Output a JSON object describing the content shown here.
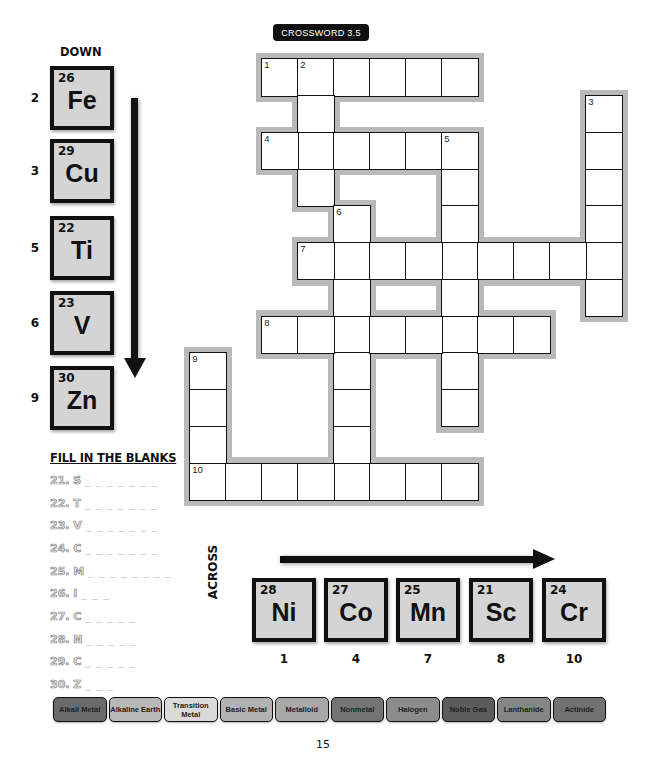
{
  "title": "CROSSWORD 3.5",
  "down": {
    "heading": "DOWN",
    "clues": [
      {
        "number": "2",
        "atomic_number": "26",
        "symbol": "Fe"
      },
      {
        "number": "3",
        "atomic_number": "29",
        "symbol": "Cu"
      },
      {
        "number": "5",
        "atomic_number": "22",
        "symbol": "Ti"
      },
      {
        "number": "6",
        "atomic_number": "23",
        "symbol": "V"
      },
      {
        "number": "9",
        "atomic_number": "30",
        "symbol": "Zn"
      }
    ]
  },
  "across": {
    "heading": "ACROSS",
    "clues": [
      {
        "number": "1",
        "atomic_number": "28",
        "symbol": "Ni"
      },
      {
        "number": "4",
        "atomic_number": "27",
        "symbol": "Co"
      },
      {
        "number": "7",
        "atomic_number": "25",
        "symbol": "Mn"
      },
      {
        "number": "8",
        "atomic_number": "21",
        "symbol": "Sc"
      },
      {
        "number": "10",
        "atomic_number": "24",
        "symbol": "Cr"
      }
    ]
  },
  "grid": {
    "origin_x": 190,
    "origin_y": 59,
    "cell_w": 36,
    "cell_h": 36.75,
    "entries": [
      {
        "number": "1",
        "dir": "across",
        "row": 0,
        "col": 2,
        "length": 6
      },
      {
        "number": "2",
        "dir": "down",
        "row": 0,
        "col": 3,
        "length": 4
      },
      {
        "number": "3",
        "dir": "down",
        "row": 1,
        "col": 11,
        "length": 6
      },
      {
        "number": "4",
        "dir": "across",
        "row": 2,
        "col": 2,
        "length": 6
      },
      {
        "number": "5",
        "dir": "down",
        "row": 2,
        "col": 7,
        "length": 8
      },
      {
        "number": "6",
        "dir": "down",
        "row": 4,
        "col": 4,
        "length": 8
      },
      {
        "number": "7",
        "dir": "across",
        "row": 5,
        "col": 3,
        "length": 9
      },
      {
        "number": "8",
        "dir": "across",
        "row": 7,
        "col": 2,
        "length": 8
      },
      {
        "number": "9",
        "dir": "down",
        "row": 8,
        "col": 0,
        "length": 4
      },
      {
        "number": "10",
        "dir": "across",
        "row": 11,
        "col": 0,
        "length": 8
      }
    ]
  },
  "fill_in_the_blanks": {
    "heading": "FILL IN THE BLANKS",
    "items": [
      {
        "label": "21. S",
        "blanks": "_ _ _ _ _ _ _"
      },
      {
        "label": "22. T",
        "blanks": "_ _ _ _ _ _ _"
      },
      {
        "label": "23. V",
        "blanks": "_ _ _ _ _ _ _"
      },
      {
        "label": "24. C",
        "blanks": "_ _ _ _ _ _ _"
      },
      {
        "label": "25. M",
        "blanks": "_ _ _ _ _ _ _ _"
      },
      {
        "label": "26. I",
        "blanks": "_ _ _"
      },
      {
        "label": "27. C",
        "blanks": "_ _ _ _ _"
      },
      {
        "label": "28. N",
        "blanks": "_ _ _ _ _"
      },
      {
        "label": "29. C",
        "blanks": "_ _ _ _ _"
      },
      {
        "label": "30. Z",
        "blanks": "_ _ _"
      }
    ]
  },
  "legend": [
    {
      "label": "Alkali Metal",
      "color": "#6a6a6a"
    },
    {
      "label": "Alkaline Earth",
      "color": "#b8b8b8"
    },
    {
      "label": "Transition Metal",
      "color": "#dadada"
    },
    {
      "label": "Basic Metal",
      "color": "#b2b2b2"
    },
    {
      "label": "Metalloid",
      "color": "#a8a8a8"
    },
    {
      "label": "Nonmetal",
      "color": "#747474"
    },
    {
      "label": "Halogen",
      "color": "#8c8c8c"
    },
    {
      "label": "Noble Gas",
      "color": "#5c5c5c"
    },
    {
      "label": "Lanthanide",
      "color": "#858585"
    },
    {
      "label": "Actinide",
      "color": "#717171"
    }
  ],
  "page_number": "15"
}
